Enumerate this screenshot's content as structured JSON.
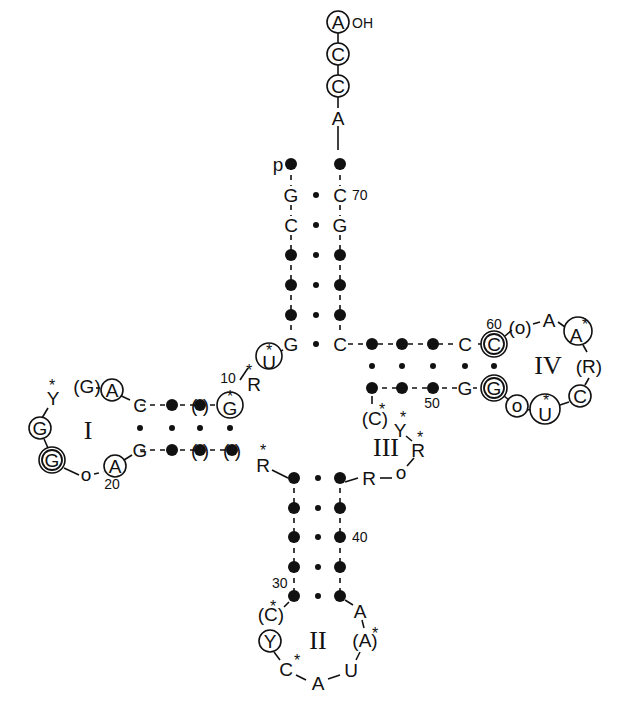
{
  "acceptor_end": {
    "label_oh": "OH",
    "label_p": "p",
    "cca": [
      "A",
      "C",
      "C"
    ],
    "discriminator": "A"
  },
  "acceptor_stem": {
    "five_prime": [
      "G",
      "C",
      "•",
      "•",
      "•",
      "G"
    ],
    "three_prime": [
      "C",
      "G",
      "•",
      "•",
      "•",
      "C"
    ],
    "number": "70"
  },
  "arms": {
    "D": {
      "roman": "I",
      "loop": [
        "(G)",
        "A",
        "C",
        "Y*",
        "G",
        "G",
        "o",
        "A"
      ],
      "number_10": "10",
      "number_20": "20"
    },
    "anticodon": {
      "roman": "II",
      "number_30": "30",
      "number_40": "40",
      "loop": [
        "(C*)",
        "Y",
        "C*",
        "A",
        "U",
        "(A*)",
        "A"
      ]
    },
    "variable": {
      "roman": "III",
      "loop": [
        "(C*)",
        "Y*",
        "R*",
        "o",
        "R"
      ],
      "number_50": "50"
    },
    "T": {
      "roman": "IV",
      "number_60": "60",
      "loop": [
        "C",
        "(o)",
        "A",
        "A*",
        "(R)",
        "C",
        "U*",
        "o",
        "G"
      ]
    }
  },
  "labels": {
    "p": "p",
    "oh": "OH",
    "n70": "70",
    "n10": "10",
    "n20": "20",
    "n30": "30",
    "n40": "40",
    "n50": "50",
    "n60": "60",
    "I": "I",
    "II": "II",
    "III": "III",
    "IV": "IV",
    "A": "A",
    "C": "C",
    "G": "G",
    "U": "U",
    "Y": "Y",
    "R": "R",
    "o": "o",
    "star": "*",
    "pG": "(G)",
    "pR": "(R)",
    "po": "(o)",
    "pC": "(C",
    "pA": "(A",
    "close": ")"
  }
}
